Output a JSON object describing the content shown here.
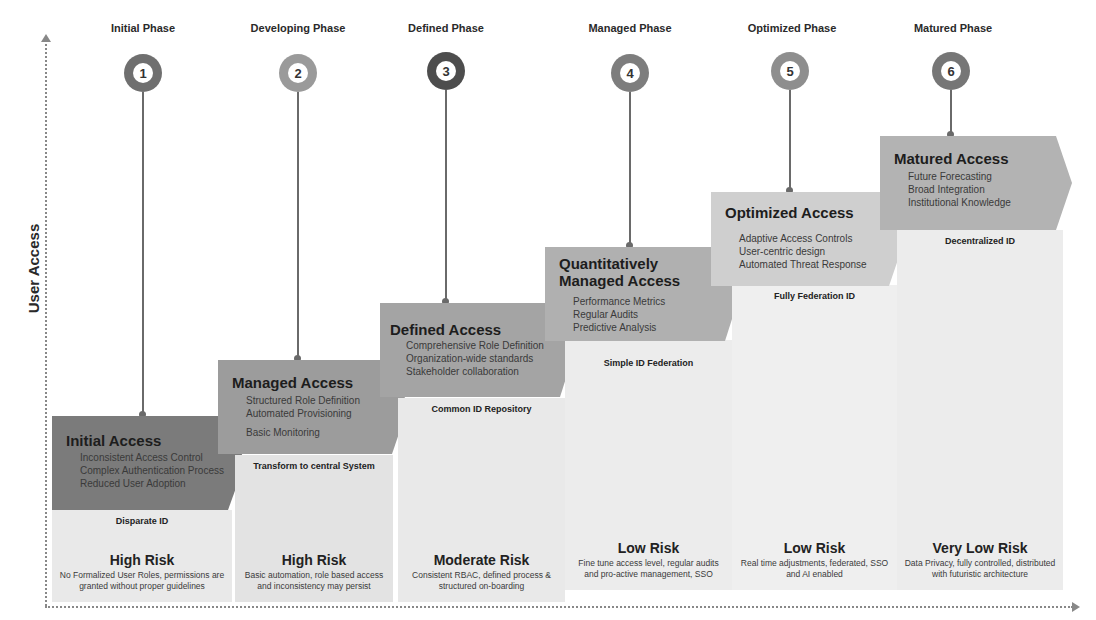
{
  "axes": {
    "y_label": "User Access"
  },
  "colors": {
    "stem": "#6a6a6a",
    "panel_bg": "#e9e9e9",
    "axis": "#888888"
  },
  "phases": [
    {
      "number": "1",
      "phase_label": "Initial Phase",
      "circle_color": "#6f6f6f",
      "chevron_color": "#7b7b7b",
      "chevron_title": "Initial Access",
      "chevron_items": [
        "Inconsistent Access Control",
        "Complex Authentication Process",
        "Reduced User Adoption"
      ],
      "id_label": "Disparate ID",
      "risk_title": "High Risk",
      "risk_desc": "No Formalized User Roles, permissions are granted without proper guidelines"
    },
    {
      "number": "2",
      "phase_label": "Developing Phase",
      "circle_color": "#9a9a9a",
      "chevron_color": "#9c9c9c",
      "chevron_title": "Managed Access",
      "chevron_items": [
        "Structured Role Definition",
        "Automated Provisioning",
        "Basic Monitoring"
      ],
      "id_label": "Transform to central System",
      "risk_title": "High Risk",
      "risk_desc": "Basic automation, role based access and inconsistency may persist"
    },
    {
      "number": "3",
      "phase_label": "Defined Phase",
      "circle_color": "#4d4d4d",
      "chevron_color": "#a4a4a4",
      "chevron_title": "Defined Access",
      "chevron_items": [
        "Comprehensive Role Definition",
        "Organization-wide standards",
        "Stakeholder collaboration"
      ],
      "id_label": "Common ID Repository",
      "risk_title": "Moderate Risk",
      "risk_desc": "Consistent RBAC, defined process & structured on-boarding"
    },
    {
      "number": "4",
      "phase_label": "Managed Phase",
      "circle_color": "#7d7d7d",
      "chevron_color": "#b0b0b0",
      "chevron_title": "Quantitatively Managed Access",
      "chevron_items": [
        "Performance Metrics",
        "Regular Audits",
        "Predictive Analysis"
      ],
      "id_label": "Simple ID Federation",
      "risk_title": "Low Risk",
      "risk_desc": "Fine tune access level, regular audits and pro-active management, SSO"
    },
    {
      "number": "5",
      "phase_label": "Optimized Phase",
      "circle_color": "#8e8e8e",
      "chevron_color": "#cfcfcf",
      "chevron_title": "Optimized Access",
      "chevron_items": [
        "Adaptive Access Controls",
        "User-centric design",
        "Automated Threat Response"
      ],
      "id_label": "Fully Federation ID",
      "risk_title": "Low Risk",
      "risk_desc": "Real time adjustments, federated, SSO and AI enabled"
    },
    {
      "number": "6",
      "phase_label": "Matured Phase",
      "circle_color": "#767676",
      "chevron_color": "#b3b3b3",
      "chevron_title": "Matured Access",
      "chevron_items": [
        "Future Forecasting",
        "Broad Integration",
        "Institutional Knowledge"
      ],
      "id_label": "Decentralized ID",
      "risk_title": "Very Low Risk",
      "risk_desc": "Data Privacy, fully controlled, distributed with futuristic architecture"
    }
  ]
}
